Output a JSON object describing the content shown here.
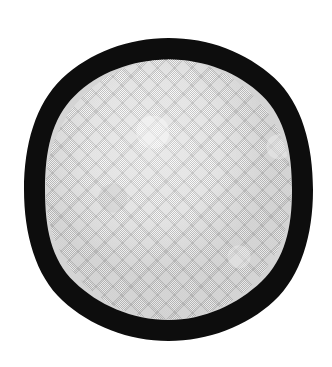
{
  "image": {
    "subject": "round-disc-with-black-rim",
    "description": "Photographic image of a circular object with a thick solid black outer ring and a light gray finely textured woven interior face, isolated on a plain white background.",
    "canvas": {
      "width": 332,
      "height": 367,
      "background_color": "#ffffff"
    },
    "text_content": "",
    "labels": [],
    "elements": {
      "background": {
        "name": "white-background",
        "color": "#ffffff"
      },
      "outer_ring": {
        "name": "black-rim",
        "color": "#0d0d0d",
        "shape": "ellipse",
        "center_x": 168.5,
        "center_y": 189.5,
        "radius_x": 144.5,
        "radius_y": 151.5,
        "thickness_px": 21
      },
      "inner_face": {
        "name": "gray-textured-face",
        "color": "#d4d4d4",
        "highlight_color": "#e2e2e2",
        "shadow_color": "#c2c2c2",
        "shape": "ellipse",
        "center_x": 168.5,
        "center_y": 189.5,
        "radius_x": 123,
        "radius_y": 130,
        "texture": "fine-diagonal-weave-halftone"
      },
      "seam": {
        "name": "horizontal-seam-line",
        "y": 206,
        "color": "#e4e4e4",
        "visible": true
      }
    }
  }
}
